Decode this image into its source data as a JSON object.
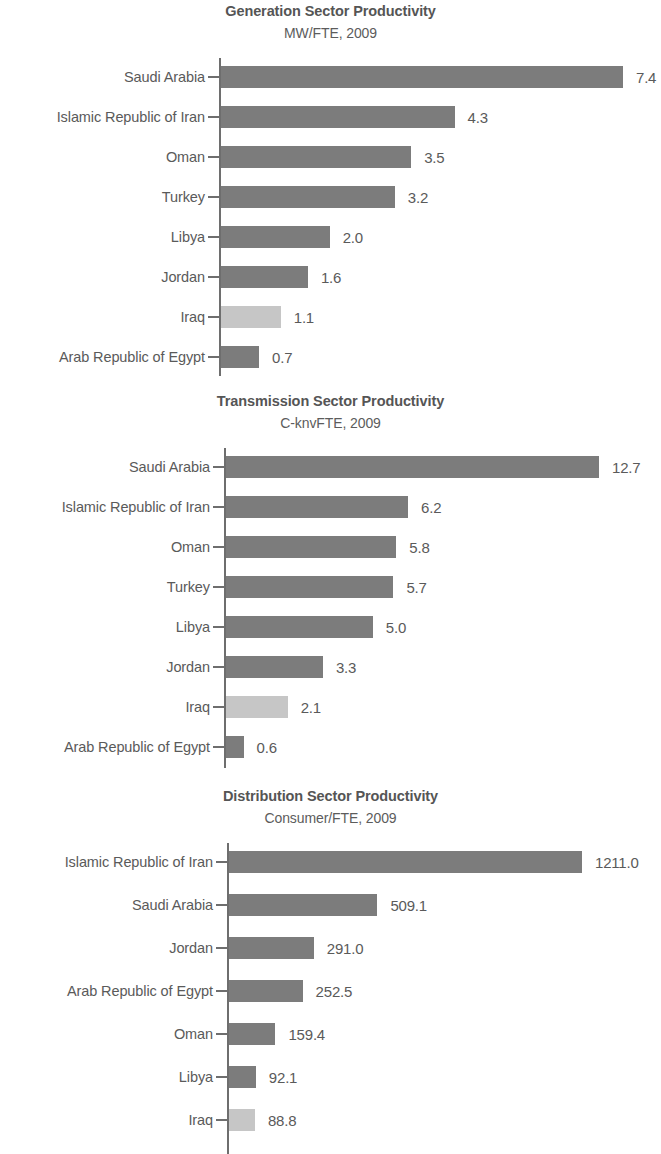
{
  "colors": {
    "bar_dark": "#7c7c7c",
    "bar_light": "#c6c6c6",
    "axis": "#6e6e6e",
    "text": "#5a5a5a"
  },
  "charts": [
    {
      "title": "Generation Sector Productivity",
      "subtitle": "MW/FTE, 2009",
      "categories": [
        "Saudi Arabia",
        "Islamic Republic of Iran",
        "Oman",
        "Turkey",
        "Libya",
        "Jordan",
        "Iraq",
        "Arab Republic of Egypt"
      ],
      "values": [
        7.4,
        4.3,
        3.5,
        3.2,
        2.0,
        1.6,
        1.1,
        0.7
      ],
      "value_labels": [
        "7.4",
        "4.3",
        "3.5",
        "3.2",
        "2.0",
        "1.6",
        "1.1",
        "0.7"
      ],
      "highlight_index": 6
    },
    {
      "title": "Transmission Sector Productivity",
      "subtitle": "C-knvFTE, 2009",
      "categories": [
        "Saudi Arabia",
        "Islamic Republic of Iran",
        "Oman",
        "Turkey",
        "Libya",
        "Jordan",
        "Iraq",
        "Arab Republic of Egypt"
      ],
      "values": [
        12.7,
        6.2,
        5.8,
        5.7,
        5.0,
        3.3,
        2.1,
        0.6
      ],
      "value_labels": [
        "12.7",
        "6.2",
        "5.8",
        "5.7",
        "5.0",
        "3.3",
        "2.1",
        "0.6"
      ],
      "highlight_index": 6
    },
    {
      "title": "Distribution Sector Productivity",
      "subtitle": "Consumer/FTE, 2009",
      "categories": [
        "Islamic Republic of Iran",
        "Saudi Arabia",
        "Jordan",
        "Arab Republic of Egypt",
        "Oman",
        "Libya",
        "Iraq"
      ],
      "values": [
        1211.0,
        509.1,
        291.0,
        252.5,
        159.4,
        92.1,
        88.8
      ],
      "value_labels": [
        "1211.0",
        "509.1",
        "291.0",
        "252.5",
        "159.4",
        "92.1",
        "88.8"
      ],
      "highlight_index": 6
    }
  ],
  "chart_data": [
    {
      "type": "bar",
      "orientation": "horizontal",
      "title": "Generation Sector Productivity",
      "subtitle": "MW/FTE, 2009",
      "xlabel": "MW/FTE",
      "ylabel": "",
      "categories": [
        "Saudi Arabia",
        "Islamic Republic of Iran",
        "Oman",
        "Turkey",
        "Libya",
        "Jordan",
        "Iraq",
        "Arab Republic of Egypt"
      ],
      "values": [
        7.4,
        4.3,
        3.5,
        3.2,
        2.0,
        1.6,
        1.1,
        0.7
      ],
      "xlim": [
        0,
        7.4
      ],
      "grid": false,
      "legend": "none",
      "annotations": [
        "Iraq bar shown in lighter gray (highlighted country)"
      ]
    },
    {
      "type": "bar",
      "orientation": "horizontal",
      "title": "Transmission Sector Productivity",
      "subtitle": "C-knvFTE, 2009",
      "xlabel": "C-knvFTE",
      "ylabel": "",
      "categories": [
        "Saudi Arabia",
        "Islamic Republic of Iran",
        "Oman",
        "Turkey",
        "Libya",
        "Jordan",
        "Iraq",
        "Arab Republic of Egypt"
      ],
      "values": [
        12.7,
        6.2,
        5.8,
        5.7,
        5.0,
        3.3,
        2.1,
        0.6
      ],
      "xlim": [
        0,
        12.7
      ],
      "grid": false,
      "legend": "none",
      "annotations": [
        "Iraq bar shown in lighter gray (highlighted country)"
      ]
    },
    {
      "type": "bar",
      "orientation": "horizontal",
      "title": "Distribution Sector Productivity",
      "subtitle": "Consumer/FTE, 2009",
      "xlabel": "Consumer/FTE",
      "ylabel": "",
      "categories": [
        "Islamic Republic of Iran",
        "Saudi Arabia",
        "Jordan",
        "Arab Republic of Egypt",
        "Oman",
        "Libya",
        "Iraq"
      ],
      "values": [
        1211.0,
        509.1,
        291.0,
        252.5,
        159.4,
        92.1,
        88.8
      ],
      "xlim": [
        0,
        1211.0
      ],
      "grid": false,
      "legend": "none",
      "annotations": [
        "Iraq bar shown in lighter gray (highlighted country)"
      ]
    }
  ]
}
